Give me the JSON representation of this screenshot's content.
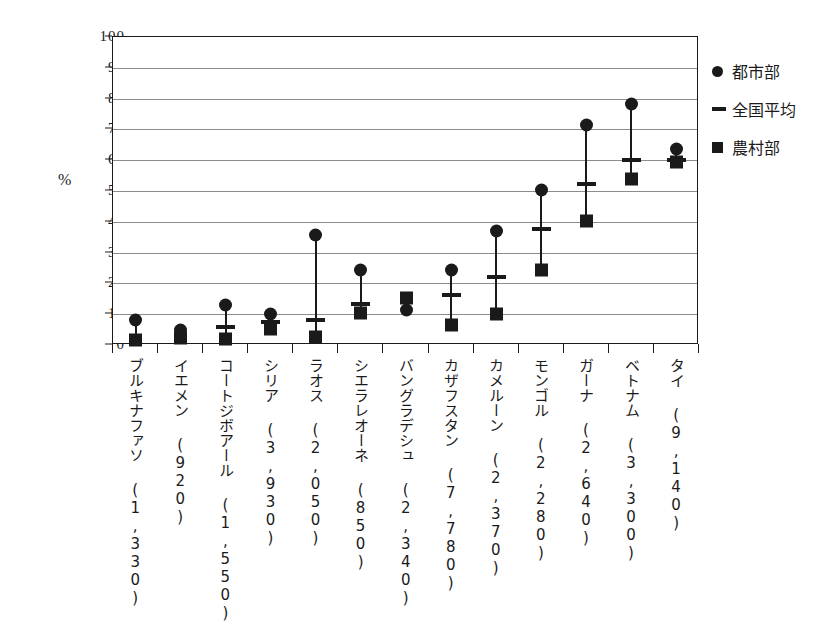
{
  "chart_data": {
    "type": "scatter",
    "title": "",
    "xlabel": "",
    "ylabel": "%",
    "ylim": [
      0,
      100
    ],
    "ytick_step": 10,
    "grid": true,
    "legend_position": "right",
    "categories": [
      "ブルキナファソ (1,330)",
      "イエメン (920)",
      "コートジボアール (1,550)",
      "シリア (3,930)",
      "ラオス (2,050)",
      "シエラレオーネ (850)",
      "バングラデシュ (2,340)",
      "カザフスタン (7,780)",
      "カメルーン (2,370)",
      "モンゴル (2,280)",
      "ガーナ (2,640)",
      "ベトナム (3,300)",
      "タイ (9,140)"
    ],
    "ytick_labels": [
      "0",
      "10",
      "20",
      "30",
      "40",
      "50",
      "60",
      "70",
      "80",
      "90",
      "100"
    ],
    "series": [
      {
        "name": "都市部",
        "marker": "circle",
        "values": [
          8.0,
          5.0,
          13.0,
          10.0,
          35.8,
          24.2,
          11.5,
          24.2,
          37.0,
          50.3,
          71.5,
          78.3,
          63.5
        ]
      },
      {
        "name": "全国平均",
        "marker": "dash",
        "values": [
          null,
          null,
          5.7,
          7.5,
          8.2,
          13.2,
          null,
          16.2,
          22.2,
          37.8,
          52.3,
          60.2,
          60.2
        ]
      },
      {
        "name": "農村部",
        "marker": "square",
        "values": [
          1.5,
          2.2,
          1.8,
          5.2,
          2.5,
          10.5,
          15.3,
          6.5,
          10.0,
          24.5,
          40.3,
          54.0,
          59.3
        ]
      }
    ]
  },
  "legend": {
    "items": [
      {
        "key": "circle",
        "label": "都市部"
      },
      {
        "key": "dash",
        "label": "全国平均"
      },
      {
        "key": "square",
        "label": "農村部"
      }
    ]
  },
  "axis": {
    "unit_label": "%"
  }
}
